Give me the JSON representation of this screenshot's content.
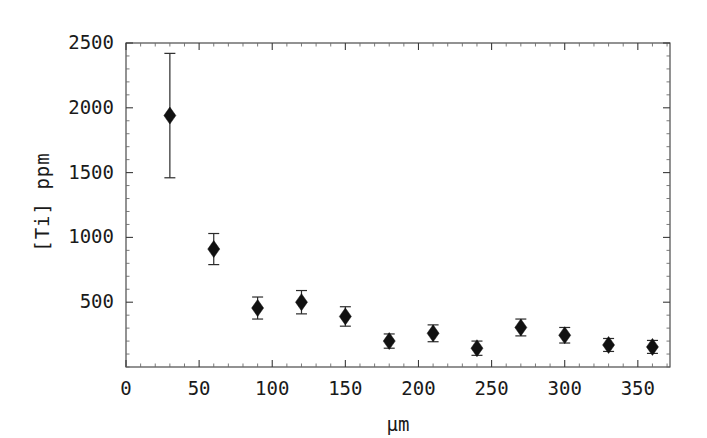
{
  "chart_data": {
    "type": "scatter",
    "title": "",
    "xlabel": "μm",
    "ylabel": "[Ti] ppm",
    "xlim": [
      0,
      372
    ],
    "ylim": [
      0,
      2500
    ],
    "grid": false,
    "legend": "none",
    "x_ticks": [
      0,
      50,
      100,
      150,
      200,
      250,
      300,
      350
    ],
    "x_tick_labels": [
      "0",
      "50",
      "100",
      "150",
      "200",
      "250",
      "300",
      "350"
    ],
    "x_minor_interval": 10,
    "y_ticks": [
      500,
      1000,
      1500,
      2000,
      2500
    ],
    "y_tick_labels": [
      "500",
      "1000",
      "1500",
      "2000",
      "2500"
    ],
    "y_minor_interval": 100,
    "error_bars": "symmetric-y",
    "marker": "filled-diamond",
    "x": [
      30,
      60,
      90,
      120,
      150,
      180,
      210,
      240,
      270,
      300,
      330,
      360
    ],
    "y": [
      1940,
      910,
      455,
      500,
      390,
      200,
      260,
      145,
      305,
      245,
      170,
      155
    ],
    "yerr": [
      480,
      120,
      85,
      90,
      75,
      55,
      65,
      55,
      65,
      60,
      50,
      50
    ],
    "series": [
      {
        "name": "[Ti] profile",
        "points": [
          {
            "x": 30,
            "y": 1940,
            "yerr": 480
          },
          {
            "x": 60,
            "y": 910,
            "yerr": 120
          },
          {
            "x": 90,
            "y": 455,
            "yerr": 85
          },
          {
            "x": 120,
            "y": 500,
            "yerr": 90
          },
          {
            "x": 150,
            "y": 390,
            "yerr": 75
          },
          {
            "x": 180,
            "y": 200,
            "yerr": 55
          },
          {
            "x": 210,
            "y": 260,
            "yerr": 65
          },
          {
            "x": 240,
            "y": 145,
            "yerr": 55
          },
          {
            "x": 270,
            "y": 305,
            "yerr": 65
          },
          {
            "x": 300,
            "y": 245,
            "yerr": 60
          },
          {
            "x": 330,
            "y": 170,
            "yerr": 50
          },
          {
            "x": 360,
            "y": 155,
            "yerr": 50
          }
        ]
      }
    ],
    "colors": {
      "marker": "#111111",
      "errorbar": "#2b2b2b",
      "axis": "#3a3a3a",
      "background": "#ffffff",
      "text": "#1a1a1a"
    }
  },
  "axes": {
    "y_title": "[Ti] ppm",
    "x_title": "μm"
  }
}
